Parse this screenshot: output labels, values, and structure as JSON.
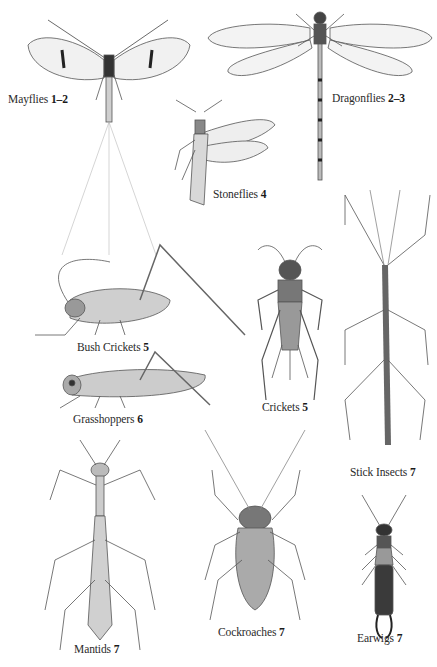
{
  "plate": {
    "title": "Insect orders identification plate",
    "background": "#ffffff",
    "ink_color": "#3a3a3a",
    "labels": [
      {
        "id": "mayflies",
        "name": "Mayflies",
        "pages": "1–2"
      },
      {
        "id": "dragonflies",
        "name": "Dragonflies",
        "pages": "2–3"
      },
      {
        "id": "stoneflies",
        "name": "Stoneflies",
        "pages": "4"
      },
      {
        "id": "bush-crickets",
        "name": "Bush Crickets",
        "pages": "5"
      },
      {
        "id": "grasshoppers",
        "name": "Grasshoppers",
        "pages": "6"
      },
      {
        "id": "crickets",
        "name": "Crickets",
        "pages": "5"
      },
      {
        "id": "stick-insects",
        "name": "Stick Insects",
        "pages": "7"
      },
      {
        "id": "mantids",
        "name": "Mantids",
        "pages": "7"
      },
      {
        "id": "cockroaches",
        "name": "Cockroaches",
        "pages": "7"
      },
      {
        "id": "earwigs",
        "name": "Earwigs",
        "pages": "7"
      }
    ]
  }
}
